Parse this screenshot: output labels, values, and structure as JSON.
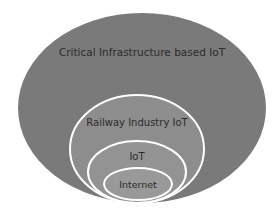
{
  "diagram": {
    "type": "nested-ellipses",
    "layers": [
      {
        "label": "Critical Infrastructure based IoT",
        "fill": "#7a7a7a"
      },
      {
        "label": "Railway Industry IoT",
        "fill": "#8d8d8d"
      },
      {
        "label": "IoT",
        "fill": "#939393"
      },
      {
        "label": "Internet",
        "fill": "#999999"
      }
    ],
    "stroke_color": "#ffffff"
  }
}
